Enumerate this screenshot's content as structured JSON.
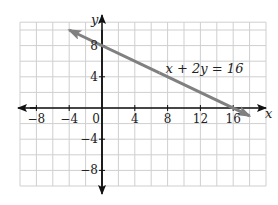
{
  "chart_data": {
    "type": "line",
    "title": "",
    "xlabel": "x",
    "ylabel": "y",
    "xlim": [
      -10,
      20
    ],
    "ylim": [
      -11,
      11
    ],
    "grid": true,
    "grid_step": 2,
    "x_ticks": [
      -8,
      -4,
      0,
      4,
      8,
      12,
      16
    ],
    "y_ticks": [
      8,
      4,
      -4,
      -8
    ],
    "x_tick_labels": [
      "−8",
      "−4",
      "0",
      "4",
      "8",
      "12",
      "16"
    ],
    "y_tick_labels": [
      "8",
      "4",
      "−4",
      "−8"
    ],
    "origin_label": "0",
    "series": [
      {
        "name": "x + 2y = 16",
        "equation": "x + 2y = 16",
        "slope": -0.5,
        "y_intercept": 8,
        "x_intercept": 16,
        "x": [
          -4,
          18
        ],
        "y": [
          10,
          -1
        ],
        "arrows": "both",
        "color": "#808080"
      }
    ],
    "annotations": [
      {
        "text": "x + 2y = 16",
        "x": 8,
        "y": 5
      }
    ]
  },
  "colors": {
    "grid": "#cfcfcf",
    "axis": "#111111",
    "line": "#808080"
  }
}
